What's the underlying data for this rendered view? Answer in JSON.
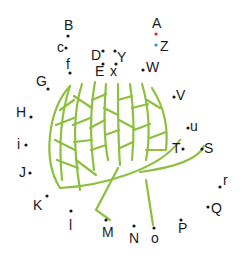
{
  "diagram": {
    "title": "",
    "colors": {
      "leaf": "#8dc03f",
      "default_label": "#1a1a1a",
      "highlight_red": "#d9262e",
      "highlight_blue": "#2a8fd6"
    },
    "labels": [
      {
        "id": "A",
        "text": "A",
        "color": "highlight_red"
      },
      {
        "id": "Z",
        "text": "Z",
        "color": "highlight_blue"
      },
      {
        "id": "B",
        "text": "B"
      },
      {
        "id": "c",
        "text": "c"
      },
      {
        "id": "f",
        "text": "f"
      },
      {
        "id": "D",
        "text": "D"
      },
      {
        "id": "Y",
        "text": "Y"
      },
      {
        "id": "E",
        "text": "E"
      },
      {
        "id": "x",
        "text": "x"
      },
      {
        "id": "W",
        "text": "W"
      },
      {
        "id": "G",
        "text": "G"
      },
      {
        "id": "V",
        "text": "V"
      },
      {
        "id": "H",
        "text": "H"
      },
      {
        "id": "u",
        "text": "u"
      },
      {
        "id": "i",
        "text": "i"
      },
      {
        "id": "T",
        "text": "T"
      },
      {
        "id": "S",
        "text": "S"
      },
      {
        "id": "J",
        "text": "J"
      },
      {
        "id": "r",
        "text": "r"
      },
      {
        "id": "K",
        "text": "K"
      },
      {
        "id": "Q",
        "text": "Q"
      },
      {
        "id": "l",
        "text": "l"
      },
      {
        "id": "M",
        "text": "M"
      },
      {
        "id": "N",
        "text": "N"
      },
      {
        "id": "o",
        "text": "o"
      },
      {
        "id": "P",
        "text": "P"
      }
    ]
  }
}
